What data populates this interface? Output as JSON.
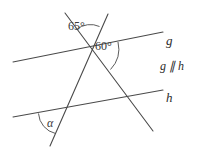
{
  "figure": {
    "type": "geometry-diagram",
    "background_color": "#ffffff",
    "line_color": "#4a4a4a",
    "text_color": "#2b2b2b"
  },
  "labels": {
    "angle_upper": "65°",
    "angle_middle": "60°",
    "angle_lower": "α",
    "line_g": "g",
    "line_h": "h",
    "parallel_note": "g ∥ h"
  },
  "geometry": {
    "lines": [
      {
        "name": "line-g",
        "label": "g",
        "x1": 13,
        "y1": 62,
        "x2": 163,
        "y2": 32
      },
      {
        "name": "line-h",
        "label": "h",
        "x1": 13,
        "y1": 117,
        "x2": 163,
        "y2": 90
      },
      {
        "name": "transversal-descending",
        "x1": 65,
        "y1": 13,
        "x2": 153,
        "y2": 131
      },
      {
        "name": "transversal-ascending",
        "x1": 108,
        "y1": 14,
        "x2": 50,
        "y2": 146
      }
    ],
    "points": {
      "apex": {
        "x": 89,
        "y": 48
      },
      "h_left": {
        "x": 60,
        "y": 112
      },
      "h_right": {
        "x": 131,
        "y": 101
      }
    },
    "arcs": [
      {
        "name": "arc-65",
        "angle": "65°"
      },
      {
        "name": "arc-60",
        "angle": "60°"
      },
      {
        "name": "arc-alpha",
        "angle": "α"
      }
    ]
  }
}
